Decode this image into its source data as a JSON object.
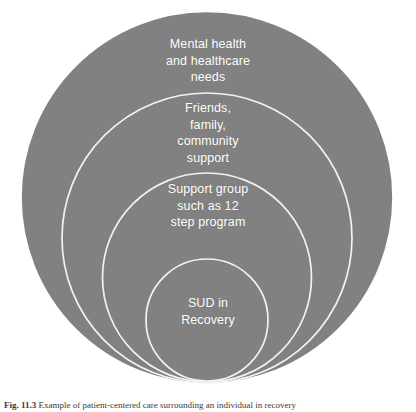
{
  "figure": {
    "type": "nested-circles-diagram",
    "background_color": "#ffffff",
    "circle_fill": "#808080",
    "circle_stroke": "#ffffff",
    "text_color": "#ffffff",
    "rings": [
      {
        "id": "outer",
        "label": "Mental health\nand healthcare\nneeds",
        "order": 1
      },
      {
        "id": "second",
        "label": "Friends,\nfamily,\ncommunity\nsupport",
        "order": 2
      },
      {
        "id": "third",
        "label": "Support group\nsuch as 12\nstep program",
        "order": 3
      },
      {
        "id": "inner",
        "label": "SUD in\nRecovery",
        "order": 4
      }
    ],
    "caption": {
      "number": "Fig. 11.3",
      "text": "Example of patient-centered care surrounding an individual in recovery"
    }
  }
}
